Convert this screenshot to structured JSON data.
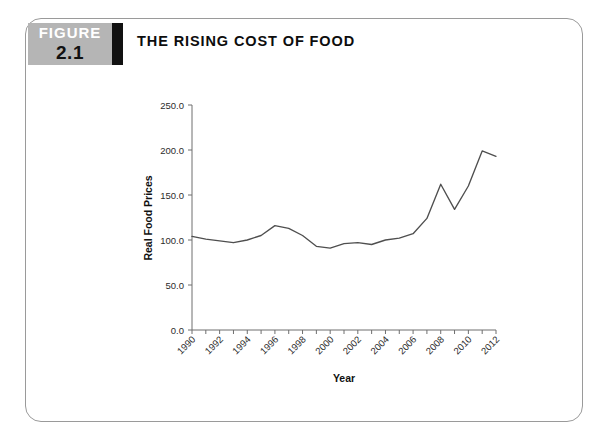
{
  "figure": {
    "badge_word": "FIGURE",
    "badge_number": "2.1",
    "title": "THE RISING COST OF FOOD",
    "badge_bg": "#b5b5b5",
    "badge_bar_color": "#111111",
    "border_color": "#9a9a9a"
  },
  "chart_data": {
    "type": "line",
    "title": "THE RISING COST OF FOOD",
    "xlabel": "Year",
    "ylabel": "Real Food Prices",
    "xlim": [
      1990,
      2012
    ],
    "ylim": [
      0.0,
      250.0
    ],
    "ytick_labels": [
      "0.0",
      "50.0",
      "100.0",
      "150.0",
      "200.0",
      "250.0"
    ],
    "ytick_values": [
      0.0,
      50.0,
      100.0,
      150.0,
      200.0,
      250.0
    ],
    "xtick_labels": [
      "1990",
      "1992",
      "1994",
      "1996",
      "1998",
      "2000",
      "2002",
      "2004",
      "2006",
      "2008",
      "2010",
      "2012"
    ],
    "xtick_values": [
      1990,
      1992,
      1994,
      1996,
      1998,
      2000,
      2002,
      2004,
      2006,
      2008,
      2010,
      2012
    ],
    "xtick_rotation": 45,
    "grid": false,
    "legend": false,
    "line_color": "#4f4f4f",
    "x": [
      1990,
      1991,
      1992,
      1993,
      1994,
      1995,
      1996,
      1997,
      1998,
      1999,
      2000,
      2001,
      2002,
      2003,
      2004,
      2005,
      2006,
      2007,
      2008,
      2009,
      2010,
      2011,
      2012
    ],
    "values": [
      104,
      101,
      99,
      97,
      100,
      105,
      116,
      113,
      105,
      93,
      91,
      96,
      97,
      95,
      100,
      102,
      107,
      124,
      162,
      134,
      160,
      199,
      193
    ],
    "series": [
      {
        "name": "Real Food Prices",
        "values": [
          104,
          101,
          99,
          97,
          100,
          105,
          116,
          113,
          105,
          93,
          91,
          96,
          97,
          95,
          100,
          102,
          107,
          124,
          162,
          134,
          160,
          199,
          193
        ]
      }
    ]
  }
}
